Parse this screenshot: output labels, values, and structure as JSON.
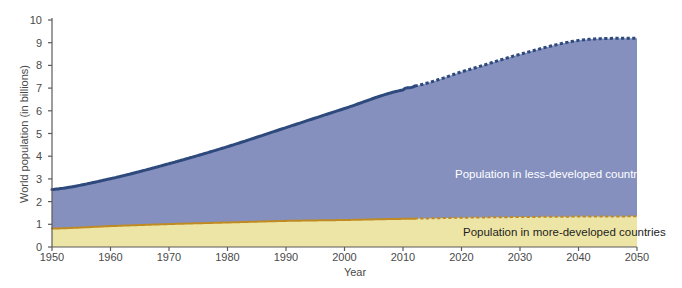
{
  "chart_data": {
    "type": "area",
    "title": "",
    "xlabel": "Year",
    "ylabel": "World population (in billions)",
    "xlim": [
      1950,
      2050
    ],
    "ylim": [
      0,
      10
    ],
    "xticks": [
      1950,
      1960,
      1970,
      1980,
      1990,
      2000,
      2010,
      2020,
      2030,
      2040,
      2050
    ],
    "yticks": [
      0,
      1,
      2,
      3,
      4,
      5,
      6,
      7,
      8,
      9,
      10
    ],
    "grid": false,
    "stacked": true,
    "legend_position": "in-plot",
    "projection_starts": 2012,
    "x": [
      1950,
      1960,
      1970,
      1980,
      1990,
      2000,
      2010,
      2012,
      2020,
      2030,
      2040,
      2050
    ],
    "series": [
      {
        "name": "Population in more-developed countries",
        "color": "#ede5a6",
        "line_color": "#c08a22",
        "values": [
          0.81,
          0.92,
          1.01,
          1.08,
          1.15,
          1.19,
          1.24,
          1.25,
          1.29,
          1.32,
          1.34,
          1.35
        ]
      },
      {
        "name": "Population in less-developed countries",
        "color": "#8590bf",
        "line_color": "#2e4a7d",
        "values": [
          1.72,
          2.09,
          2.66,
          3.34,
          4.11,
          4.91,
          5.68,
          5.84,
          6.43,
          7.17,
          7.76,
          7.85
        ]
      }
    ],
    "totals": [
      2.53,
      3.01,
      3.67,
      4.42,
      5.26,
      6.1,
      6.92,
      7.09,
      7.72,
      8.49,
      9.1,
      9.2
    ],
    "annotations": [
      "Population in less-developed countries",
      "Population in more-developed countries"
    ],
    "credit": "(Compiled by the authors using data from United Nations Population Division and Population Reference Bureau.)"
  },
  "axes": {
    "y_title": "World population (in billions)",
    "x_title": "Year",
    "y_tick_labels": [
      "0",
      "1",
      "2",
      "3",
      "4",
      "5",
      "6",
      "7",
      "8",
      "9",
      "10"
    ],
    "x_tick_labels": [
      "1950",
      "1960",
      "1970",
      "1980",
      "1990",
      "2000",
      "2010",
      "2020",
      "2030",
      "2040",
      "2050"
    ]
  },
  "labels": {
    "less_developed": "Population in less-developed countries",
    "more_developed": "Population in more-developed countries"
  },
  "credit": {
    "text": "(Compiled by the authors using data from United Nations Population Division and Population Reference Bureau.)"
  },
  "colors": {
    "less_developed_fill": "#8590bf",
    "less_developed_line": "#2e4a7d",
    "more_developed_fill": "#ede5a6",
    "more_developed_line": "#c08a22",
    "axis": "#5b5b5b",
    "background": "#ffffff"
  }
}
